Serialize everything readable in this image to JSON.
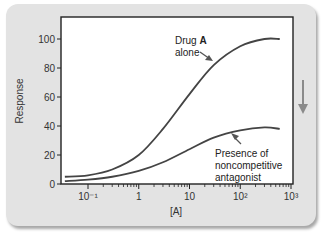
{
  "chart_data": {
    "type": "line",
    "title": "",
    "xlabel": "[A]",
    "ylabel": "Response",
    "xscale": "log",
    "xlim": [
      0.035,
      1000
    ],
    "ylim": [
      0,
      115
    ],
    "x_ticks": [
      "10⁻¹",
      "1",
      "10",
      "10²",
      "10³"
    ],
    "x_tick_values": [
      0.1,
      1,
      10,
      100,
      1000
    ],
    "y_ticks": [
      "0",
      "20",
      "40",
      "60",
      "80",
      "100"
    ],
    "y_tick_values": [
      0,
      20,
      40,
      60,
      80,
      100
    ],
    "grid": false,
    "series": [
      {
        "name": "Drug A alone",
        "x": [
          0.035,
          0.1,
          0.3,
          1,
          3,
          10,
          30,
          100,
          300,
          600
        ],
        "values": [
          5,
          6,
          10,
          20,
          38,
          62,
          82,
          95,
          100,
          100
        ]
      },
      {
        "name": "Presence of noncompetitive antagonist",
        "x": [
          0.035,
          0.1,
          0.3,
          1,
          3,
          10,
          30,
          100,
          300,
          600
        ],
        "values": [
          2,
          3,
          5,
          9,
          15,
          24,
          32,
          37,
          39,
          38
        ]
      }
    ],
    "annotations": [
      {
        "text_line1": "Drug ",
        "text_bold": "A",
        "text_line2": "alone",
        "points_to": "Drug A alone"
      },
      {
        "text_line1": "Presence of",
        "text_line2": "noncompetitive",
        "text_line3": "antagonist",
        "points_to": "Presence of noncompetitive antagonist"
      }
    ],
    "side_indicator": "downward-arrow"
  },
  "colors": {
    "panel": "#e3e3e3",
    "plot_bg": "#ffffff",
    "curve": "#444444",
    "side_arrow": "#8a8a8a"
  }
}
